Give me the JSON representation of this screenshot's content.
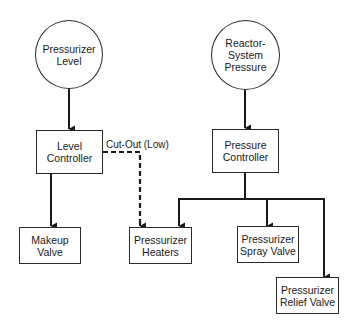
{
  "diagram": {
    "type": "control-block-diagram",
    "colors": {
      "line": "#1a1a1a",
      "background": "#ffffff"
    },
    "nodes": {
      "pressurizer_level": {
        "label": "Pressurizer\nLevel",
        "shape": "circle"
      },
      "reactor_pressure": {
        "label": "Reactor-\nSystem\nPressure",
        "shape": "circle"
      },
      "level_controller": {
        "label": "Level\nController",
        "shape": "box"
      },
      "pressure_controller": {
        "label": "Pressure\nController",
        "shape": "box"
      },
      "makeup_valve": {
        "label": "Makeup\nValve",
        "shape": "box"
      },
      "pressurizer_heaters": {
        "label": "Pressurizer\nHeaters",
        "shape": "box"
      },
      "spray_valve": {
        "label": "Pressurizer\nSpray Valve",
        "shape": "box"
      },
      "relief_valve": {
        "label": "Pressurizer\nRelief Valve",
        "shape": "box"
      }
    },
    "edges": [
      {
        "from": "Pressurizer Level",
        "to": "Level Controller",
        "style": "solid"
      },
      {
        "from": "Level Controller",
        "to": "Makeup Valve",
        "style": "solid"
      },
      {
        "from": "Level Controller",
        "to": "Pressurizer Heaters",
        "style": "dashed",
        "label": "Cut-Out (Low)"
      },
      {
        "from": "Reactor-System Pressure",
        "to": "Pressure Controller",
        "style": "solid"
      },
      {
        "from": "Pressure Controller",
        "to": "Pressurizer Heaters",
        "style": "solid"
      },
      {
        "from": "Pressure Controller",
        "to": "Pressurizer Spray Valve",
        "style": "solid"
      },
      {
        "from": "Pressure Controller",
        "to": "Pressurizer Relief Valve",
        "style": "solid"
      }
    ],
    "edge_labels": {
      "cutout": "Cut-Out (Low)"
    }
  }
}
